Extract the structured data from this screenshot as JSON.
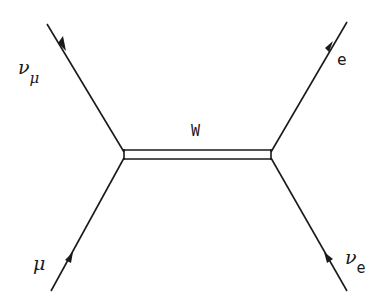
{
  "diagram": {
    "type": "feynman",
    "propagator": {
      "label": "W"
    },
    "particles": {
      "top_left": {
        "symbol": "ν",
        "subscript": "μ"
      },
      "top_right": {
        "symbol": "e",
        "subscript": ""
      },
      "bottom_left": {
        "symbol": "μ",
        "subscript": ""
      },
      "bottom_right": {
        "symbol": "ν",
        "subscript": "e"
      }
    },
    "colors": {
      "line": "#1a1a1a",
      "background": "#ffffff"
    }
  }
}
